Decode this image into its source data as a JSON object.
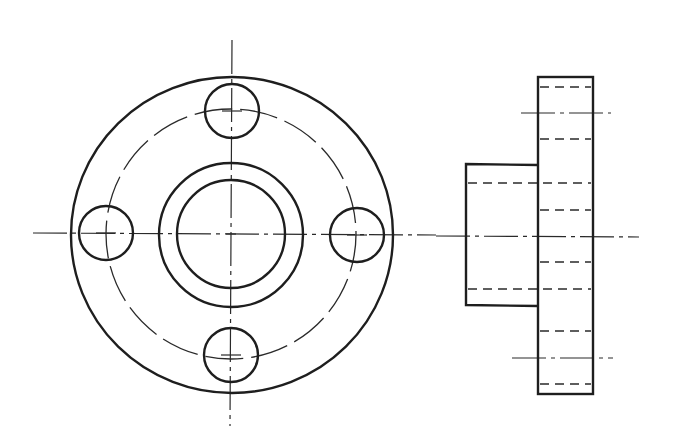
{
  "drawing": {
    "type": "orthographic-projection",
    "subject": "flange with central boss and four bolt holes",
    "colors": {
      "line": "#1e1e1e",
      "background": "#ffffff"
    },
    "views": [
      {
        "name": "front-view",
        "description": "circular face view"
      },
      {
        "name": "side-view",
        "description": "profile view with hidden lines"
      }
    ],
    "front_view": {
      "center": [
        231,
        234
      ],
      "outer_circle_r": [
        161,
        158
      ],
      "bolt_circle_r": 125,
      "boss_outer_r": 72,
      "bore_r": 54,
      "bolt_hole_r": 27,
      "bolt_holes": [
        [
          232,
          111
        ],
        [
          106,
          233
        ],
        [
          357,
          235
        ],
        [
          231,
          355
        ]
      ]
    },
    "side_view": {
      "flange_rect": {
        "x": 538,
        "y": 77,
        "w": 55,
        "h": 317
      },
      "boss_rect": {
        "x": 466,
        "y": 164,
        "w": 72,
        "h": 142
      },
      "axis_y": 236,
      "hidden_lines_flange_y": [
        87,
        139,
        210,
        262,
        331,
        384
      ],
      "hidden_lines_bore_y": [
        183,
        289
      ]
    }
  }
}
